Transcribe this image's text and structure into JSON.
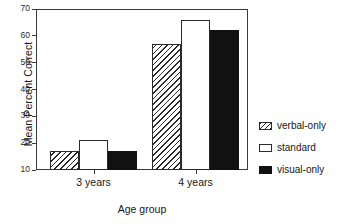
{
  "chart_data": {
    "type": "bar",
    "title": "",
    "xlabel": "Age group",
    "ylabel": "Mean Percent Correct",
    "categories": [
      "3 years",
      "4 years"
    ],
    "series": [
      {
        "name": "verbal-only",
        "values": [
          17,
          57
        ],
        "fill": "hatched",
        "color": "#2b2b2b"
      },
      {
        "name": "standard",
        "values": [
          21,
          66
        ],
        "fill": "white",
        "color": "#ffffff"
      },
      {
        "name": "visual-only",
        "values": [
          17,
          62
        ],
        "fill": "solid",
        "color": "#111111"
      }
    ],
    "ylim": [
      10,
      70
    ],
    "yticks": [
      10,
      20,
      30,
      40,
      50,
      60,
      70
    ],
    "ytick_labels": [
      "10",
      "20",
      "30",
      "40",
      "50",
      "60",
      "70"
    ],
    "grid": false,
    "legend_position": "right",
    "legend_entries": [
      "verbal-only",
      "standard",
      "visual-only"
    ]
  }
}
